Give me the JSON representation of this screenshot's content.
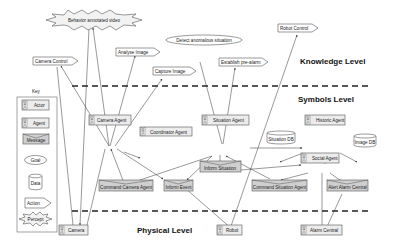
{
  "levels": {
    "knowledge": "Knowledge Level",
    "symbols": "Symbols Level",
    "physical": "Physical Level"
  },
  "key": {
    "title": "Key",
    "items": [
      {
        "type": "actor",
        "label": "Actor"
      },
      {
        "type": "agent",
        "label": "Agent"
      },
      {
        "type": "message",
        "label": "Message"
      },
      {
        "type": "goal",
        "label": "Goal"
      },
      {
        "type": "data",
        "label": "Data"
      },
      {
        "type": "action",
        "label": "Action"
      },
      {
        "type": "percept",
        "label": "Percept"
      }
    ]
  },
  "nodes": {
    "behavior_video": "Behavior annotated video",
    "camera_control": "Camera Control",
    "analyse_image": "Analyse Image",
    "capture_image": "Capture Image",
    "detect_anomalous": "Detect anomalous situation",
    "establish_prealarm": "Establish pre-alarm",
    "robot_control": "Robot Control",
    "camera_agent": "Camera Agent",
    "coordinator_agent": "Coordinator Agent",
    "situation_agent": "Situation Agent",
    "historic_agent": "Historic Agent",
    "situation_db": "Situation DB",
    "image_db": "Image DB",
    "social_agent": "Social Agent",
    "inform_situation": "Inform Situation",
    "command_camera_agent": "Command Camera Agent",
    "inform_event": "Inform Event",
    "command_situation_agent": "Command Situation Agent",
    "alert_alarm_central": "Alert Alarm Central",
    "camera": "Camera",
    "robot": "Robot",
    "alarm_central": "Alarm Central"
  }
}
